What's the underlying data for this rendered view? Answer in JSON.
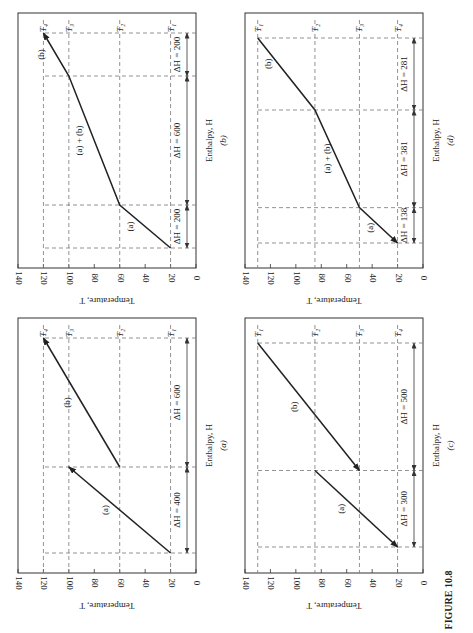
{
  "figure_title": "FIGURE 10.8",
  "orientation": "rotated 90° counter-clockwise (page landscape)",
  "chart_data": [
    {
      "id": "a",
      "type": "line",
      "caption": "(a)",
      "xlabel": "Enthalpy, H",
      "ylabel": "Temperature, T",
      "ylim": [
        0,
        140
      ],
      "yticks": [
        0,
        20,
        40,
        60,
        80,
        100,
        120,
        140
      ],
      "grid_levels": [
        {
          "name": "T1",
          "label": "T₁",
          "value": 20
        },
        {
          "name": "T2",
          "label": "T₂",
          "value": 60
        },
        {
          "name": "T3",
          "label": "T₃",
          "value": 100
        },
        {
          "name": "T4",
          "label": "T₄",
          "value": 120
        }
      ],
      "series": [
        {
          "name": "(a)",
          "points": [
            [
              0,
              20
            ],
            [
              400,
              100
            ]
          ],
          "arrow": "end"
        },
        {
          "name": "(b)",
          "points": [
            [
              400,
              60
            ],
            [
              1000,
              120
            ]
          ],
          "arrow": "end"
        }
      ],
      "dimensions": [
        {
          "from": 0,
          "to": 400,
          "label": "ΔH = 400"
        },
        {
          "from": 400,
          "to": 1000,
          "label": "ΔH = 600"
        }
      ],
      "h_total": 1000
    },
    {
      "id": "b",
      "type": "line",
      "caption": "(b)",
      "xlabel": "Enthalpy, H",
      "ylabel": "Temperature, T",
      "ylim": [
        0,
        140
      ],
      "yticks": [
        0,
        20,
        40,
        60,
        80,
        100,
        120,
        140
      ],
      "grid_levels": [
        {
          "name": "T1",
          "label": "T₁",
          "value": 20
        },
        {
          "name": "T2",
          "label": "T₂",
          "value": 60
        },
        {
          "name": "T3",
          "label": "T₃",
          "value": 100
        },
        {
          "name": "T4",
          "label": "T₄",
          "value": 120
        }
      ],
      "series": [
        {
          "name": "composite",
          "points": [
            [
              0,
              20
            ],
            [
              200,
              60
            ],
            [
              800,
              100
            ],
            [
              1000,
              120
            ]
          ],
          "arrow": "end"
        }
      ],
      "segment_labels": [
        {
          "text": "(a)",
          "at_h": 100,
          "at_t": 40
        },
        {
          "text": "(a) + (b)",
          "at_h": 500,
          "at_t": 80
        },
        {
          "text": "(b)",
          "at_h": 900,
          "at_t": 110
        }
      ],
      "dimensions": [
        {
          "from": 0,
          "to": 200,
          "label": "ΔH = 200"
        },
        {
          "from": 200,
          "to": 800,
          "label": "ΔH = 600"
        },
        {
          "from": 800,
          "to": 1000,
          "label": "ΔH = 200"
        }
      ],
      "h_total": 1000
    },
    {
      "id": "c",
      "type": "line",
      "caption": "(c)",
      "xlabel": "Enthalpy, H",
      "ylabel": "Temperature, T",
      "ylim": [
        0,
        140
      ],
      "yticks": [
        0,
        20,
        40,
        60,
        80,
        100,
        120,
        140
      ],
      "grid_levels": [
        {
          "name": "T1",
          "label": "T₁",
          "value": 130
        },
        {
          "name": "T2",
          "label": "T₂",
          "value": 85
        },
        {
          "name": "T3",
          "label": "T₃",
          "value": 50
        },
        {
          "name": "T4",
          "label": "T₄",
          "value": 20
        }
      ],
      "series": [
        {
          "name": "(a)",
          "points": [
            [
              300,
              85
            ],
            [
              0,
              20
            ]
          ],
          "arrow": "end"
        },
        {
          "name": "(b)",
          "points": [
            [
              800,
              130
            ],
            [
              300,
              50
            ]
          ],
          "arrow": "end"
        }
      ],
      "dimensions": [
        {
          "from": 0,
          "to": 300,
          "label": "ΔH = 300"
        },
        {
          "from": 300,
          "to": 800,
          "label": "ΔH = 500"
        }
      ],
      "h_total": 800
    },
    {
      "id": "d",
      "type": "line",
      "caption": "(d)",
      "xlabel": "Enthalpy, H",
      "ylabel": "Temperature, T",
      "ylim": [
        0,
        140
      ],
      "yticks": [
        0,
        20,
        40,
        60,
        80,
        100,
        120,
        140
      ],
      "grid_levels": [
        {
          "name": "T1",
          "label": "T₁",
          "value": 130
        },
        {
          "name": "T2",
          "label": "T₂",
          "value": 85
        },
        {
          "name": "T3",
          "label": "T₃",
          "value": 50
        },
        {
          "name": "T4",
          "label": "T₄",
          "value": 20
        }
      ],
      "series": [
        {
          "name": "composite",
          "points": [
            [
              800,
              130
            ],
            [
              519,
              85
            ],
            [
              138,
              50
            ],
            [
              0,
              20
            ]
          ],
          "arrow": "end"
        }
      ],
      "segment_labels": [
        {
          "text": "(a)",
          "at_h": 60,
          "at_t": 30
        },
        {
          "text": "(a) + (b)",
          "at_h": 330,
          "at_t": 64
        },
        {
          "text": "(b)",
          "at_h": 700,
          "at_t": 110
        }
      ],
      "dimensions": [
        {
          "from": 0,
          "to": 138,
          "label": "ΔH = 138"
        },
        {
          "from": 138,
          "to": 519,
          "label": "ΔH = 381"
        },
        {
          "from": 519,
          "to": 800,
          "label": "ΔH = 281"
        }
      ],
      "h_total": 800
    }
  ],
  "layout": {
    "panels": {
      "b": {
        "tLeft": 18,
        "tRight": 196,
        "boxTop": 13,
        "boxBottom": 268,
        "hStart": 248,
        "hEnd": 33
      },
      "a": {
        "tLeft": 18,
        "tRight": 196,
        "boxTop": 318,
        "boxBottom": 573,
        "hStart": 553,
        "hEnd": 338
      },
      "d": {
        "tLeft": 245,
        "tRight": 423,
        "boxTop": 13,
        "boxBottom": 268,
        "hStart": 243,
        "hEnd": 38
      },
      "c": {
        "tLeft": 245,
        "tRight": 423,
        "boxTop": 318,
        "boxBottom": 573,
        "hStart": 547,
        "hEnd": 343
      }
    },
    "figure_title_pos": [
      450,
      600
    ]
  }
}
